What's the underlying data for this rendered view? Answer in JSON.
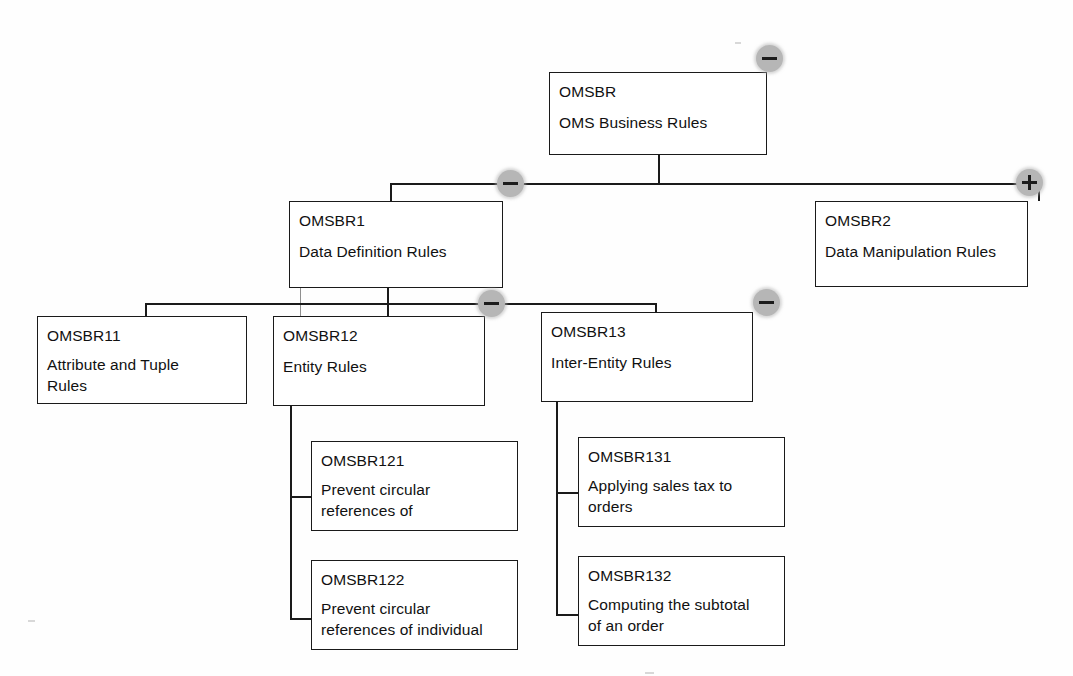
{
  "diagram": {
    "type": "tree",
    "title": "OMS Business Rules",
    "background": "#ffffff",
    "line_color": "#1a1a1a",
    "toggle_color": "#b6b6b6",
    "toggle_glyph_color": "#1c1c1c"
  },
  "nodes": {
    "root": {
      "code": "OMSBR",
      "desc_line1": "OMS Business Rules",
      "desc_line2": ""
    },
    "n1": {
      "code": "OMSBR1",
      "desc_line1": "Data Definition Rules",
      "desc_line2": ""
    },
    "n2": {
      "code": "OMSBR2",
      "desc_line1": "Data Manipulation Rules",
      "desc_line2": ""
    },
    "n11": {
      "code": "OMSBR11",
      "desc_line1": "Attribute and Tuple",
      "desc_line2": "Rules"
    },
    "n12": {
      "code": "OMSBR12",
      "desc_line1": "Entity Rules",
      "desc_line2": ""
    },
    "n13": {
      "code": "OMSBR13",
      "desc_line1": "Inter-Entity Rules",
      "desc_line2": ""
    },
    "n121": {
      "code": "OMSBR121",
      "desc_line1": "Prevent circular",
      "desc_line2": "references of"
    },
    "n122": {
      "code": "OMSBR122",
      "desc_line1": "Prevent circular",
      "desc_line2": "references of individual"
    },
    "n131": {
      "code": "OMSBR131",
      "desc_line1": "Applying sales tax to",
      "desc_line2": "orders"
    },
    "n132": {
      "code": "OMSBR132",
      "desc_line1": "Computing the subtotal",
      "desc_line2": "of an order"
    }
  },
  "toggles": {
    "root": {
      "state": "expanded",
      "glyph": "minus-icon"
    },
    "n1": {
      "state": "expanded",
      "glyph": "minus-icon"
    },
    "n2": {
      "state": "collapsed",
      "glyph": "plus-icon"
    },
    "n12": {
      "state": "expanded",
      "glyph": "minus-icon"
    },
    "n13": {
      "state": "expanded",
      "glyph": "minus-icon"
    }
  }
}
